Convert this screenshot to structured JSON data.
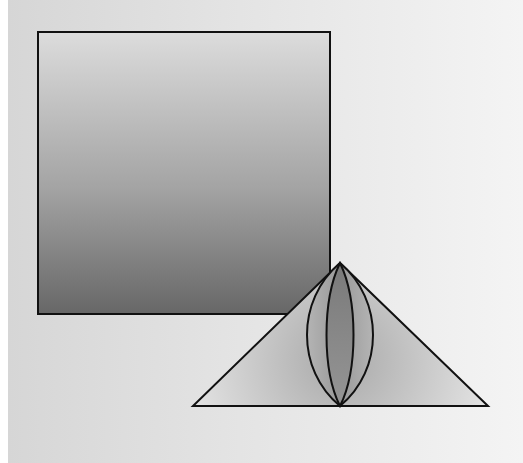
{
  "scene": {
    "background": {
      "left_color": "#d6d6d6",
      "right_color": "#f4f4f4"
    },
    "shapes": [
      {
        "kind": "square",
        "x": 38,
        "y": 32,
        "width": 292,
        "height": 282,
        "gradient": {
          "direction": "vertical",
          "top": "#dcdcdc",
          "bottom": "#676767"
        },
        "stroke": "#111111"
      },
      {
        "kind": "triangle",
        "points": [
          [
            340,
            263
          ],
          [
            193,
            406
          ],
          [
            488,
            406
          ]
        ],
        "gradient": {
          "type": "radial",
          "center": "#a9a9a9",
          "edge": "#e2e2e2"
        },
        "stroke": "#111111"
      },
      {
        "kind": "outer-lens",
        "top": [
          340,
          263
        ],
        "bottom": [
          340,
          406
        ],
        "half_width": 34,
        "fill": "#9a9a9a",
        "stroke": "#111111"
      },
      {
        "kind": "inner-lens",
        "top": [
          340,
          263
        ],
        "bottom": [
          340,
          406
        ],
        "half_width": 14,
        "fill": "#858585",
        "stroke": "#111111"
      }
    ]
  }
}
